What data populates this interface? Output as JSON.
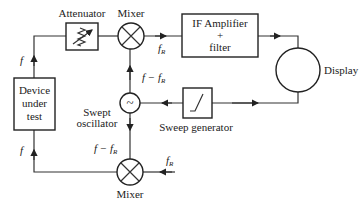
{
  "blocks": {
    "attenuator": "Attenuator",
    "mixer_top": "Mixer",
    "if_amp_line1": "IF Amplifier",
    "if_amp_line2": "+",
    "if_amp_line3": "filter",
    "display": "Display",
    "dut_line1": "Device",
    "dut_line2": "under",
    "dut_line3": "test",
    "swept_osc_line1": "Swept",
    "swept_osc_line2": "oscillator",
    "osc_symbol": "~",
    "sweep_gen": "Sweep generator",
    "mixer_bottom": "Mixer"
  },
  "signals": {
    "f_top": "f",
    "f_bottom": "f",
    "fR_top_main": "f",
    "fR_top_sub": "R",
    "f_minus_fR_top_main": "f − f",
    "f_minus_fR_top_sub": "R",
    "f_minus_fR_bot_main": "f − f",
    "f_minus_fR_bot_sub": "R",
    "fR_bot_main": "f",
    "fR_bot_sub": "R"
  }
}
